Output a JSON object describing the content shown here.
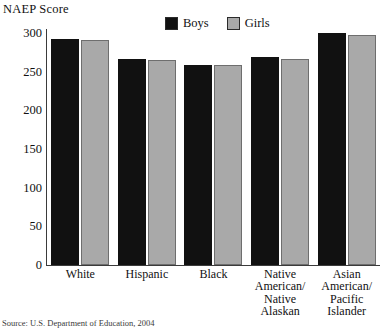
{
  "chart_data": {
    "type": "bar",
    "title": "",
    "ylabel": "NAEP Score",
    "xlabel": "",
    "ylim": [
      0,
      300
    ],
    "yticks": [
      300,
      250,
      200,
      150,
      100,
      50,
      0
    ],
    "grid": false,
    "legend_position": "top-center",
    "categories": [
      "White",
      "Hispanic",
      "Black",
      "Native American/ Native Alaskan",
      "Asian American/ Pacific Islander"
    ],
    "category_lines": [
      [
        "White"
      ],
      [
        "Hispanic"
      ],
      [
        "Black"
      ],
      [
        "Native",
        "American/",
        "Native",
        "Alaskan"
      ],
      [
        "Asian",
        "American/",
        "Pacific",
        "Islander"
      ]
    ],
    "series": [
      {
        "name": "Boys",
        "color": "#111111",
        "values": [
          292,
          266,
          258,
          269,
          300
        ]
      },
      {
        "name": "Girls",
        "color": "#a9a9a9",
        "values": [
          291,
          265,
          259,
          266,
          298
        ]
      }
    ]
  },
  "legend": {
    "items": [
      {
        "label": "Boys",
        "color": "#111111"
      },
      {
        "label": "Girls",
        "color": "#a9a9a9"
      }
    ]
  },
  "source": {
    "text": "Source: U.S. Department of Education, 2004"
  }
}
